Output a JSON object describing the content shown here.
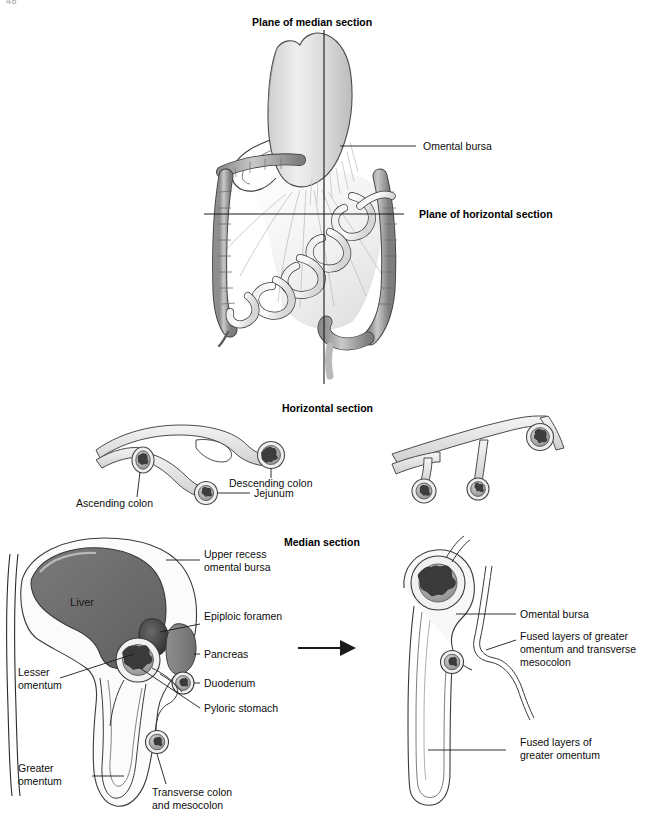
{
  "page": {
    "number": "48",
    "width": 662,
    "height": 826,
    "background": "#ffffff"
  },
  "colors": {
    "ink": "#1a1a1a",
    "outline": "#2b2b2b",
    "membrane_fill": "#e8e8e8",
    "cavity_fill": "#f7f7f7",
    "organ_dark": "#6e6e6e",
    "organ_mid": "#9a9a9a",
    "lumen_dark": "#4a4a4a",
    "gut_shade": "#b5b5b5"
  },
  "figures": {
    "top": {
      "name": "abdominal-viscera-overview",
      "labels": {
        "plane_median": "Plane of median section",
        "plane_horizontal": "Plane of horizontal section",
        "omental_bursa": "Omental bursa"
      }
    },
    "horizontal": {
      "title": "Horizontal section",
      "left_panel": {
        "name": "horizontal-section-before",
        "labels": {
          "ascending_colon": "Ascending colon",
          "jejunum": "Jejunum",
          "descending_colon": "Descending colon"
        }
      },
      "right_panel": {
        "name": "horizontal-section-after",
        "labels": []
      }
    },
    "median": {
      "title": "Median section",
      "left_panel": {
        "name": "median-section-before",
        "labels": {
          "liver": "Liver",
          "upper_recess_omental_bursa": "Upper recess\nomental bursa",
          "upper_recess_line1": "Upper recess",
          "upper_recess_line2": "omental bursa",
          "epiploic_foramen": "Epiploic foramen",
          "pancreas": "Pancreas",
          "duodenum": "Duodenum",
          "pyloric_stomach": "Pyloric stomach",
          "lesser_omentum_line1": "Lesser",
          "lesser_omentum_line2": "omentum",
          "greater_omentum_line1": "Greater",
          "greater_omentum_line2": "omentum",
          "transverse_colon_line1": "Transverse colon",
          "transverse_colon_line2": "and mesocolon"
        }
      },
      "arrow": {
        "name": "transformation-arrow",
        "direction": "right"
      },
      "right_panel": {
        "name": "median-section-after",
        "labels": {
          "omental_bursa": "Omental bursa",
          "fused_greater_transverse_line1": "Fused layers of greater",
          "fused_greater_transverse_line2": "omentum and transverse",
          "fused_greater_transverse_line3": "mesocolon",
          "fused_greater_line1": "Fused layers of",
          "fused_greater_line2": "greater omentum"
        }
      }
    }
  }
}
